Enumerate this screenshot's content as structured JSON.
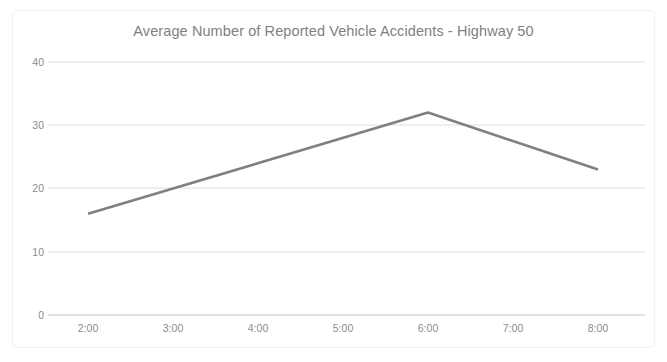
{
  "chart_data": {
    "type": "line",
    "title": "Average Number of Reported Vehicle Accidents - Highway 50",
    "xlabel": "",
    "ylabel": "",
    "categories": [
      "2:00",
      "3:00",
      "4:00",
      "5:00",
      "6:00",
      "7:00",
      "8:00"
    ],
    "values": [
      16,
      20,
      24,
      28,
      32,
      27.5,
      23
    ],
    "vertices": [
      {
        "x": "2:00",
        "y": 16
      },
      {
        "x": "6:00",
        "y": 32
      },
      {
        "x": "8:00",
        "y": 23
      }
    ],
    "series": [
      {
        "name": "Average Number of Reported Vehicle Accidents",
        "values": [
          16,
          20,
          24,
          28,
          32,
          27.5,
          23
        ],
        "color": "#808080"
      }
    ],
    "ylim": [
      0,
      40
    ],
    "yticks": [
      0,
      10,
      20,
      30,
      40
    ],
    "ytick_labels": [
      "0",
      "10",
      "20",
      "30",
      "40"
    ],
    "xtick_labels": [
      "2:00",
      "3:00",
      "4:00",
      "5:00",
      "6:00",
      "7:00",
      "8:00"
    ],
    "grid": true,
    "grid_axis": "y",
    "legend": false,
    "legend_position": "none",
    "markers": false,
    "colors": {
      "line": "#808080",
      "grid": "#e8e8e8",
      "axis": "#d9d9d9",
      "tick_text": "#8c8c8c",
      "title_text": "#7f7f7f",
      "background": "#ffffff",
      "frame_border": "#f0f0f0"
    }
  }
}
